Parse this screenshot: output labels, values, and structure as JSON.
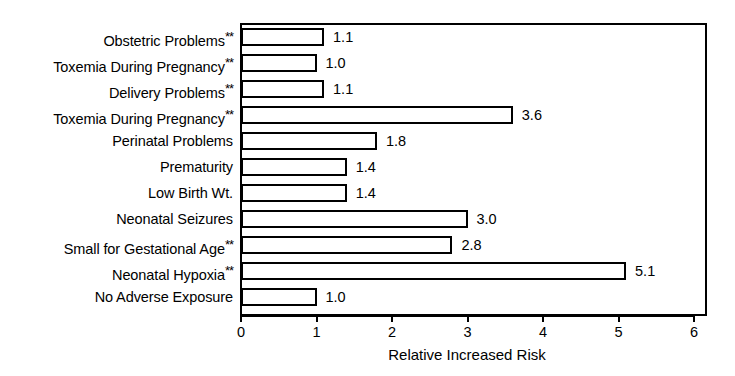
{
  "chart_data": {
    "type": "bar",
    "orientation": "horizontal",
    "title": "",
    "xlabel": "Relative Increased Risk",
    "ylabel": "",
    "xlim": [
      0,
      6
    ],
    "xticks": [
      "0",
      "1",
      "2",
      "3",
      "4",
      "5",
      "6"
    ],
    "grid": false,
    "legend": null,
    "categories": [
      "Obstetric Problems",
      "Toxemia During Pregnancy",
      "Delivery Problems",
      "Toxemia During Pregnancy",
      "Perinatal Problems",
      "Prematurity",
      "Low Birth Wt.",
      "Neonatal Seizures",
      "Small for Gestational Age",
      "Neonatal Hypoxia",
      "No Adverse Exposure"
    ],
    "values": [
      1.1,
      1.0,
      1.1,
      3.6,
      1.8,
      1.4,
      1.4,
      3.0,
      2.8,
      5.1,
      1.0
    ],
    "value_labels": [
      "1.1",
      "1.0",
      "1.1",
      "3.6",
      "1.8",
      "1.4",
      "1.4",
      "3.0",
      "2.8",
      "5.1",
      "1.0"
    ],
    "significance_marks": [
      "**",
      "**",
      "**",
      "**",
      "",
      "",
      "",
      "",
      "**",
      "**",
      ""
    ],
    "bar_facecolor": "#ffffff",
    "bar_edgecolor": "#000000",
    "text_color": "#000000",
    "background_color": "#ffffff"
  }
}
